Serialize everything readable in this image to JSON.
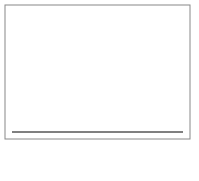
{
  "chart_data": {
    "type": "bar",
    "title": "",
    "xlabel": "F",
    "ylabel": "",
    "xlim": [
      0,
      8
    ],
    "xticks": [
      "0",
      "1",
      "2",
      "3",
      "4",
      "5",
      "6",
      "7",
      "8"
    ],
    "bin_width": 0.2,
    "bins_start": [
      0.0,
      0.2,
      0.4,
      0.6,
      0.8,
      1.0,
      1.2,
      1.4,
      1.6,
      1.8,
      2.0,
      2.2,
      2.4,
      2.6,
      2.8,
      3.0,
      3.2,
      3.4,
      3.6,
      3.8,
      4.0,
      4.2,
      4.4,
      4.6,
      4.8,
      5.0,
      5.2,
      5.4,
      5.6,
      5.8,
      6.0,
      6.2,
      6.4,
      6.6,
      6.8,
      7.0,
      7.2,
      7.4,
      7.6,
      7.8
    ],
    "values": [
      0.33,
      0.85,
      0.98,
      0.93,
      0.84,
      0.66,
      0.64,
      0.48,
      0.4,
      0.32,
      0.26,
      0.19,
      0.18,
      0.17,
      0.12,
      0.1,
      0.08,
      0.09,
      0.06,
      0.05,
      0.04,
      0.03,
      0.025,
      0.02,
      0.015,
      0.012,
      0.01,
      0.008,
      0.007,
      0.006,
      0.005,
      0.004,
      0.004,
      0.003,
      0.003,
      0.002,
      0.002,
      0.002,
      0.001,
      0.001
    ],
    "curve": "F-distribution density overlay",
    "grid": false,
    "legend": null
  },
  "colors": {
    "bar": "#7a7a7a",
    "bar_edge": "#333333",
    "curve": "#000000",
    "frame": "#888888"
  }
}
